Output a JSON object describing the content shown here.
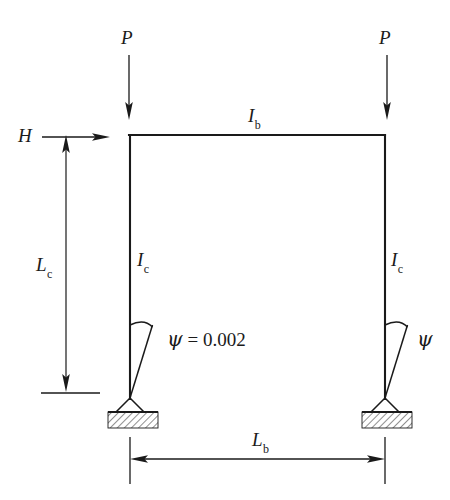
{
  "figure": {
    "type": "structural-engineering-diagram",
    "colors": {
      "ink": "#1a1a1a",
      "background": "#ffffff",
      "hatch": "#333333"
    },
    "loads": {
      "left_vertical": {
        "symbol": "P",
        "direction": "down"
      },
      "right_vertical": {
        "symbol": "P",
        "direction": "down"
      },
      "lateral": {
        "symbol": "H",
        "direction": "right"
      }
    },
    "members": {
      "beam": {
        "symbol": "I",
        "subscript": "b",
        "name": "beam-moment-of-inertia"
      },
      "left_column": {
        "symbol": "I",
        "subscript": "c",
        "name": "left-column-moment-of-inertia"
      },
      "right_column": {
        "symbol": "I",
        "subscript": "c",
        "name": "right-column-moment-of-inertia"
      }
    },
    "dimensions": {
      "column_length": {
        "symbol": "L",
        "subscript": "c",
        "name": "column-length"
      },
      "beam_length": {
        "symbol": "L",
        "subscript": "b",
        "name": "beam-length"
      }
    },
    "imperfections": {
      "left": {
        "symbol": "ψ",
        "relation": " = ",
        "value": "0.002"
      },
      "right": {
        "symbol": "ψ",
        "relation": "",
        "value": ""
      }
    },
    "supports": {
      "left": "pinned-hatched-base",
      "right": "pinned-hatched-base"
    }
  }
}
